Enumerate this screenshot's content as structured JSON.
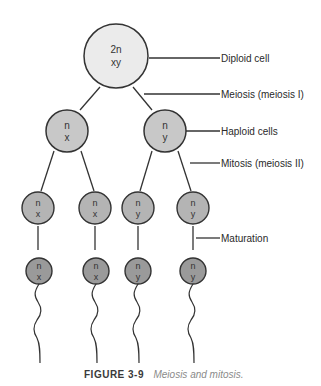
{
  "figure": {
    "caption_label": "FIGURE 3-9",
    "caption_text": "Meiosis and mitosis."
  },
  "colors": {
    "diploid_fill": "#ebebeb",
    "haploid_fill": "#c8c8c8",
    "spermatid_fill": "#b4b4b4",
    "sperm_fill": "#9a9a9a",
    "stroke": "#333333"
  },
  "cells": {
    "diploid": {
      "line1": "2n",
      "line2": "xy"
    },
    "haploid": [
      {
        "line1": "n",
        "line2": "x"
      },
      {
        "line1": "n",
        "line2": "y"
      }
    ],
    "spermatids": [
      {
        "line1": "n",
        "line2": "x"
      },
      {
        "line1": "n",
        "line2": "x"
      },
      {
        "line1": "n",
        "line2": "y"
      },
      {
        "line1": "n",
        "line2": "y"
      }
    ],
    "sperm": [
      {
        "line1": "n",
        "line2": "x"
      },
      {
        "line1": "n",
        "line2": "x"
      },
      {
        "line1": "n",
        "line2": "y"
      },
      {
        "line1": "n",
        "line2": "y"
      }
    ]
  },
  "labels": {
    "diploid_cell": "Diploid cell",
    "meiosis": "Meiosis (meiosis I)",
    "haploid_cells": "Haploid cells",
    "mitosis": "Mitosis (meiosis II)",
    "maturation": "Maturation"
  }
}
